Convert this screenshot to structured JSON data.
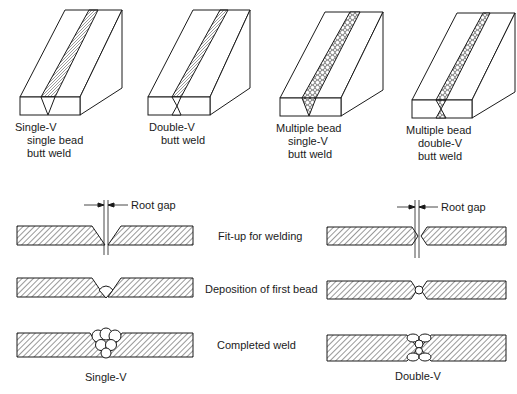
{
  "top_views": [
    {
      "id": "single-v-single-bead",
      "lines": [
        "Single-V",
        "single bead",
        "butt weld"
      ]
    },
    {
      "id": "double-v",
      "lines": [
        "Double-V",
        "butt weld"
      ]
    },
    {
      "id": "multiple-bead-single-v",
      "lines": [
        "Multiple bead",
        "single-V",
        "butt weld"
      ]
    },
    {
      "id": "multiple-bead-double-v",
      "lines": [
        "Multiple bead",
        "double-V",
        "butt weld"
      ]
    }
  ],
  "cross_sections": {
    "root_gap_label": "Root gap",
    "stages": [
      "Fit-up for welding",
      "Deposition of first bead",
      "Completed weld"
    ],
    "left_caption": "Single-V",
    "right_caption": "Double-V"
  },
  "colors": {
    "ink": "#1a1a1a",
    "background": "#ffffff"
  }
}
